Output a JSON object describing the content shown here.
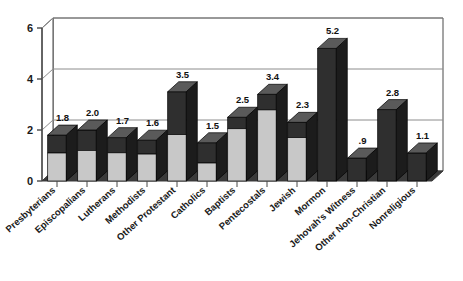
{
  "chart_data": {
    "type": "bar",
    "title": "",
    "subtitle": "",
    "xlabel": "",
    "ylabel": "",
    "ylim": [
      0,
      6
    ],
    "yticks": [
      0,
      2,
      4,
      6
    ],
    "ytick_labels": [
      "0",
      "2",
      "4",
      "6"
    ],
    "grid": true,
    "grid_axis": "y",
    "legend": "none",
    "three_d": true,
    "categories": [
      "Presbyterians",
      "Episcopalians",
      "Lutherans",
      "Methodists",
      "Other Protestant",
      "Catholics",
      "Baptists",
      "Pentecostals",
      "Jewish",
      "Mormon",
      "Jehovah's Witness",
      "Other Non-Christian",
      "Nonreligious"
    ],
    "values": [
      1.8,
      2.0,
      1.7,
      1.6,
      3.5,
      1.5,
      2.5,
      3.4,
      2.3,
      5.2,
      0.9,
      2.8,
      1.1
    ],
    "data_labels": [
      "1.8",
      "2.0",
      "1.7",
      "1.6",
      "3.5",
      "1.5",
      "2.5",
      "3.4",
      "2.3",
      "5.2",
      ".9",
      "2.8",
      "1.1"
    ],
    "split_fractions": [
      0.61,
      0.6,
      0.65,
      0.66,
      0.52,
      0.47,
      0.82,
      0.82,
      0.74,
      0.0,
      0.0,
      0.0,
      0.0
    ],
    "colors": {
      "bar_front_light": "#c8c8c8",
      "bar_front_dark": "#2f2f2f",
      "bar_top": "#5a5a5a",
      "bar_side": "#1c1c1c",
      "floor": "#3a3a3a",
      "axis": "#4a4a4a",
      "grid": "#8c8c8c",
      "background": "#ffffff",
      "text": "#1a1a1a"
    }
  }
}
